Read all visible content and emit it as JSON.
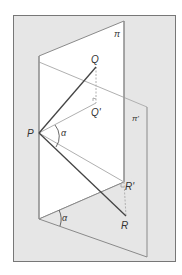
{
  "figure": {
    "colors": {
      "frame_fill": "#e6e6e6",
      "frame_stroke": "#777777",
      "plane_pi_fill": "#ffffff",
      "plane_pi_prime_fill": "#e6e6e6",
      "edge": "#8a8a8a",
      "segment": "#444444",
      "projection": "#b0b0b0"
    },
    "labels": {
      "pi": "π",
      "pi_prime": "π'",
      "P": "P",
      "Q": "Q",
      "Q_prime": "Q'",
      "R": "R",
      "R_prime": "R'",
      "alpha_top": "α",
      "alpha_bottom": "α"
    },
    "points": {
      "P": [
        39,
        133
      ],
      "Q": [
        96,
        67
      ],
      "Q_prime": [
        96,
        103
      ],
      "R": [
        126,
        216
      ],
      "R_prime": [
        124,
        182
      ],
      "pi_bottom_left": [
        39,
        219
      ]
    }
  }
}
